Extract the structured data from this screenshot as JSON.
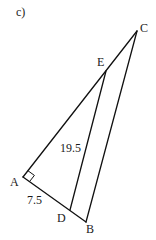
{
  "figure_label": "c)",
  "points": {
    "A": "A",
    "B": "B",
    "C": "C",
    "D": "D",
    "E": "E"
  },
  "segments": [
    {
      "from": "A",
      "to": "B"
    },
    {
      "from": "A",
      "to": "C"
    },
    {
      "from": "B",
      "to": "C"
    },
    {
      "from": "D",
      "to": "E"
    }
  ],
  "right_angle_at": "A",
  "measurements": {
    "DE": "19.5",
    "AD": "7.5"
  },
  "line_color": "#111111"
}
